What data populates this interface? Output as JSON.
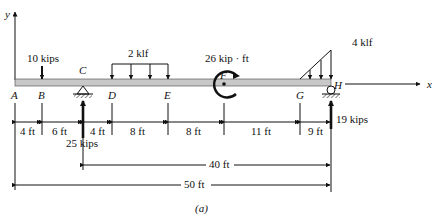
{
  "figure": {
    "caption": "(a)",
    "axes": {
      "y_label": "y",
      "x_label": "x"
    },
    "points": [
      "A",
      "B",
      "C",
      "D",
      "E",
      "F",
      "G",
      "H"
    ],
    "loads": {
      "point_load": "10 kips",
      "uniform_load": "2 klf",
      "moment": "26 kip · ft",
      "triangular_load": "4 klf"
    },
    "reactions": {
      "C": "25 kips",
      "H": "19 kips"
    },
    "dimensions": {
      "segments": [
        "4 ft",
        "6 ft",
        "4 ft",
        "8 ft",
        "8 ft",
        "11 ft",
        "9 ft"
      ],
      "span_C_to_H": "40 ft",
      "total": "50 ft"
    }
  },
  "colors": {
    "beam_fill": "#c8c8c8",
    "ink": "#111111"
  }
}
